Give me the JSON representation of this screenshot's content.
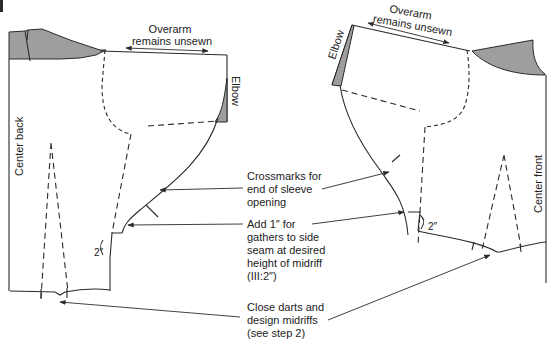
{
  "figure": {
    "back_piece": {
      "center_label": "Center back",
      "overarm_label_line1": "Overarm",
      "overarm_label_line2": "remains unsewn",
      "elbow_label": "Elbow",
      "measure_label": "2″"
    },
    "front_piece": {
      "center_label": "Center front",
      "overarm_label_line1": "Overarm",
      "overarm_label_line2": "remains unsewn",
      "elbow_label": "Elbow",
      "measure_label": "2″"
    },
    "callouts": [
      {
        "id": "crossmarks",
        "lines": [
          "Crossmarks for",
          "end of sleeve",
          "opening"
        ]
      },
      {
        "id": "add-gathers",
        "lines": [
          "Add 1″ for",
          "gathers to side",
          "seam at desired",
          "height of midriff",
          "(III:2″)"
        ]
      },
      {
        "id": "close-darts",
        "lines": [
          "Close darts and",
          "design midriffs",
          "(see step 2)"
        ]
      }
    ],
    "colors": {
      "line": "#2a2a2a",
      "shade": "#9e9e9e",
      "background": "#ffffff"
    }
  }
}
